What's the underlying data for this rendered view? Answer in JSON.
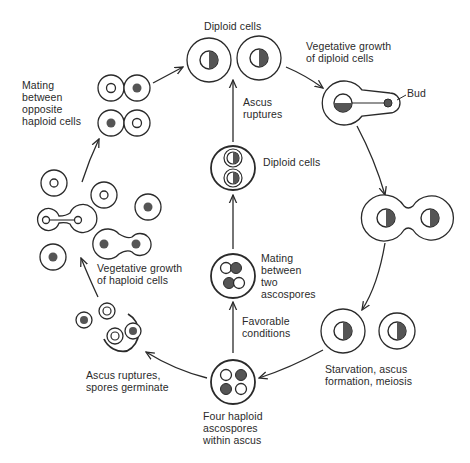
{
  "diagram": {
    "colors": {
      "stroke": "#2a2a2a",
      "nucleus_fill": "#555555",
      "background": "#ffffff"
    },
    "labels": {
      "diploid_cells_top": "Diploid cells",
      "vegetative_growth_diploid_1": "Vegetative growth",
      "vegetative_growth_diploid_2": "of diploid cells",
      "bud": "Bud",
      "ascus_ruptures_1": "Ascus",
      "ascus_ruptures_2": "ruptures",
      "diploid_cells_center": "Diploid cells",
      "mating_ascospores_1": "Mating",
      "mating_ascospores_2": "between",
      "mating_ascospores_3": "two",
      "mating_ascospores_4": "ascospores",
      "favorable_1": "Favorable",
      "favorable_2": "conditions",
      "starvation_1": "Starvation, ascus",
      "starvation_2": "formation, meiosis",
      "four_haploid_1": "Four haploid",
      "four_haploid_2": "ascospores",
      "four_haploid_3": "within ascus",
      "ascus_rupt_spores_1": "Ascus ruptures,",
      "ascus_rupt_spores_2": "spores germinate",
      "veg_haploid_1": "Vegetative growth",
      "veg_haploid_2": "of haploid cells",
      "mating_haploid_1": "Mating",
      "mating_haploid_2": "between",
      "mating_haploid_3": "opposite",
      "mating_haploid_4": "haploid cells"
    },
    "stages": [
      "Diploid cells",
      "Vegetative growth of diploid cells",
      "Budding diploid cell",
      "Starvation, ascus formation, meiosis",
      "Four haploid ascospores within ascus",
      "Ascus ruptures, spores germinate",
      "Vegetative growth of haploid cells",
      "Mating between opposite haploid cells",
      "Favorable conditions",
      "Mating between two ascospores",
      "Diploid cells (in ascus)",
      "Ascus ruptures"
    ]
  }
}
